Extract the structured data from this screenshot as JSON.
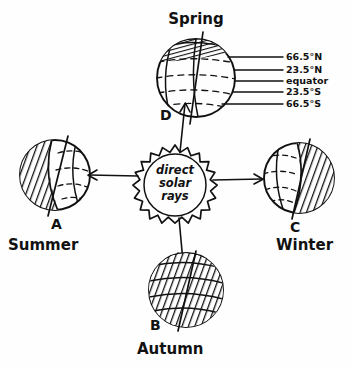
{
  "diagram": {
    "title_text": "Spring",
    "background_color": "#fefefe",
    "ink_color": "#111111",
    "sun": {
      "label_line1": "direct",
      "label_line2": "solar",
      "label_line3": "rays",
      "shape": "sun-burst-circle"
    },
    "earths": [
      {
        "position": "top",
        "point_label": "D",
        "season": "Spring",
        "shading": "polar-cap-hatched",
        "axis_tilt_deg": 23.5
      },
      {
        "position": "left",
        "point_label": "A",
        "season": "Summer",
        "shading": "left-half-hatched",
        "axis_tilt_deg": 23.5
      },
      {
        "position": "right",
        "point_label": "C",
        "season": "Winter",
        "shading": "right-half-hatched",
        "axis_tilt_deg": 23.5
      },
      {
        "position": "bottom",
        "point_label": "B",
        "season": "Autumn",
        "shading": "full-hatched",
        "axis_tilt_deg": 23.5
      }
    ],
    "latitude_labels": [
      "66.5°N",
      "23.5°N",
      "equator",
      "23.5°S",
      "66.5°S"
    ],
    "arrows": [
      {
        "name": "ray-to-left-earth",
        "direction": "left"
      },
      {
        "name": "ray-to-right-earth",
        "direction": "right"
      },
      {
        "name": "ray-to-top-earth",
        "direction": "up"
      },
      {
        "name": "ray-to-bottom-earth",
        "direction": "down"
      }
    ]
  }
}
